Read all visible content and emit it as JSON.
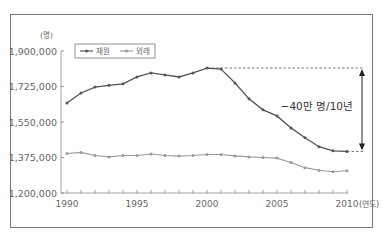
{
  "chart_data": {
    "type": "line",
    "title": "",
    "xlabel": "(연도)",
    "ylabel": "(명)",
    "ylim": [
      1200000,
      1900000
    ],
    "yticks": [
      "1,900,000",
      "1,725,000",
      "1,550,000",
      "1,375,000",
      "1,200,000"
    ],
    "ytick_values": [
      1900000,
      1725000,
      1550000,
      1375000,
      1200000
    ],
    "xticks": [
      "1990",
      "1995",
      "2000",
      "2005",
      "2010"
    ],
    "x": [
      1990,
      1991,
      1992,
      1993,
      1994,
      1995,
      1996,
      1997,
      1998,
      1999,
      2000,
      2001,
      2002,
      2003,
      2004,
      2005,
      2006,
      2007,
      2008,
      2009,
      2010
    ],
    "series": [
      {
        "name": "재원",
        "color": "#555555",
        "values": [
          1644000,
          1693000,
          1722000,
          1731000,
          1738000,
          1772000,
          1792000,
          1782000,
          1772000,
          1792000,
          1816000,
          1811000,
          1742000,
          1664000,
          1610000,
          1580000,
          1521000,
          1472000,
          1428000,
          1408000,
          1405000
        ]
      },
      {
        "name": "외래",
        "color": "#9a9a9a",
        "values": [
          1395000,
          1400000,
          1385000,
          1378000,
          1385000,
          1385000,
          1392000,
          1385000,
          1382000,
          1385000,
          1390000,
          1390000,
          1383000,
          1378000,
          1375000,
          1372000,
          1350000,
          1325000,
          1312000,
          1305000,
          1310000
        ]
      }
    ],
    "legend_position": "top-left inside",
    "grid": false,
    "annotations": [
      {
        "text": "−40만 명/10년",
        "type": "double-arrow",
        "from": 1816000,
        "to": 1405000
      }
    ]
  },
  "labels": {
    "unit_y": "(명)",
    "unit_x": "(연도)",
    "annotation": "−40만 명/10년",
    "legend_1": "재원",
    "legend_2": "외래"
  }
}
